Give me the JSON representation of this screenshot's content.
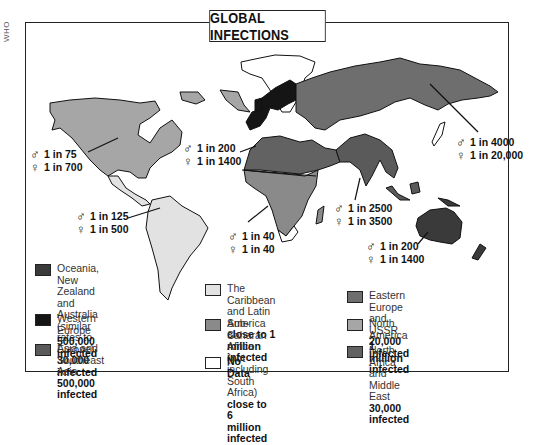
{
  "source_label": "WHO",
  "title": "GLOBAL INFECTIONS",
  "colors": {
    "oceania": "#3a3a3a",
    "western_europe": "#151515",
    "asia_se_asia": "#5a5a5a",
    "caribbean_latin_america": "#e2e2e2",
    "sub_saharan_africa": "#8a8a8a",
    "no_data": "#ffffff",
    "eastern_europe_ussr": "#6e6e6e",
    "north_america": "#a6a6a6",
    "north_africa_middle_east": "#626262"
  },
  "rates": [
    {
      "region": "North America",
      "male": "1 in 75",
      "female": "1 in 700"
    },
    {
      "region": "Western Europe",
      "male": "1 in 200",
      "female": "1 in 1400"
    },
    {
      "region": "East Asia",
      "male": "1 in 4000",
      "female": "1 in 20,000"
    },
    {
      "region": "Latin America",
      "male": "1 in 125",
      "female": "1 in 500"
    },
    {
      "region": "Sub-Saharan Africa",
      "male": "1 in 40",
      "female": "1 in 40"
    },
    {
      "region": "South and Southeast Asia",
      "male": "1 in 2500",
      "female": "1 in 3500"
    },
    {
      "region": "Australia",
      "male": "1 in 200",
      "female": "1 in 1400"
    }
  ],
  "symbols": {
    "male": "♂",
    "female": "♀"
  },
  "legend": [
    {
      "label": "Oceania, New Zealand\nand Australia (similar\nrates to Europe)",
      "count": "30,000 infected",
      "color_key": "oceania"
    },
    {
      "label": "Western Europe",
      "count": "500,000 infected",
      "color_key": "western_europe"
    },
    {
      "label": "Asia and Southeast Asia",
      "count": "500,000 infected",
      "color_key": "asia_se_asia"
    },
    {
      "label": "The Caribbean and Latin\nAmerica",
      "count": "close to 1 million infected",
      "color_key": "caribbean_latin_america"
    },
    {
      "label": "Sub-Saharan Africa\n(not including South Africa)",
      "count": "close to 6 million infected",
      "color_key": "sub_saharan_africa"
    },
    {
      "label": "",
      "count": "No Data",
      "color_key": "no_data"
    },
    {
      "label": "Eastern Europe and USSR",
      "count": "20,000 infected",
      "color_key": "eastern_europe_ussr"
    },
    {
      "label": "North America",
      "count": "1 million infected",
      "color_key": "north_america"
    },
    {
      "label": "North Africa and Middle East",
      "count": "30,000 infected",
      "color_key": "north_africa_middle_east"
    }
  ]
}
